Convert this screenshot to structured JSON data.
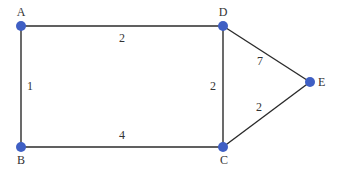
{
  "graph": {
    "nodes": [
      {
        "id": "A",
        "label": "A"
      },
      {
        "id": "B",
        "label": "B"
      },
      {
        "id": "C",
        "label": "C"
      },
      {
        "id": "D",
        "label": "D"
      },
      {
        "id": "E",
        "label": "E"
      }
    ],
    "edges": [
      {
        "from": "A",
        "to": "D",
        "weight": "2"
      },
      {
        "from": "A",
        "to": "B",
        "weight": "1"
      },
      {
        "from": "D",
        "to": "C",
        "weight": "2"
      },
      {
        "from": "D",
        "to": "E",
        "weight": "7"
      },
      {
        "from": "C",
        "to": "E",
        "weight": "2"
      },
      {
        "from": "B",
        "to": "C",
        "weight": "4"
      }
    ],
    "colors": {
      "node": "#3f5fc4",
      "edge": "#2b2b2b",
      "text": "#333333"
    }
  }
}
